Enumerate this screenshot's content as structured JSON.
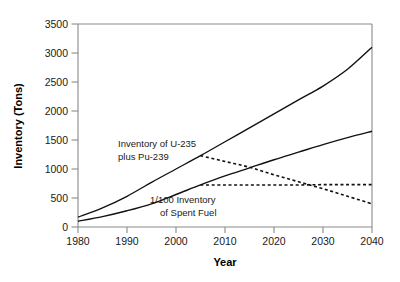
{
  "chart_data": {
    "type": "line",
    "title": "",
    "xlabel": "Year",
    "ylabel": "Inventory (Tons)",
    "xlim": [
      1980,
      2040
    ],
    "ylim": [
      0,
      3500
    ],
    "xticks": [
      1980,
      1990,
      2000,
      2010,
      2020,
      2030,
      2040
    ],
    "yticks": [
      0,
      500,
      1000,
      1500,
      2000,
      2500,
      3000,
      3500
    ],
    "xtick_labels": [
      "1980",
      "1990",
      "2000",
      "2010",
      "2020",
      "2030",
      "2040"
    ],
    "ytick_labels": [
      "0",
      "500",
      "1000",
      "1500",
      "2000",
      "2500",
      "3000",
      "3500"
    ],
    "grid": false,
    "legend": "none",
    "line_color": "#000000",
    "axis_color": "#808080",
    "series": [
      {
        "name": "Inventory of U-235 plus Pu-239",
        "style": "solid",
        "x": [
          1980,
          1985,
          1990,
          1995,
          2000,
          2005,
          2010,
          2015,
          2020,
          2025,
          2030,
          2035,
          2040
        ],
        "values": [
          170,
          330,
          530,
          770,
          1000,
          1230,
          1470,
          1710,
          1950,
          2190,
          2430,
          2720,
          3100
        ]
      },
      {
        "name": "1/100 Inventory of Spent Fuel",
        "style": "solid",
        "x": [
          1980,
          1985,
          1990,
          1995,
          2000,
          2005,
          2010,
          2015,
          2020,
          2025,
          2030,
          2035,
          2040
        ],
        "values": [
          100,
          180,
          280,
          400,
          560,
          725,
          880,
          1020,
          1160,
          1290,
          1420,
          1540,
          1650
        ]
      },
      {
        "name": "Inventory of U-235 plus Pu-239 (declining projection)",
        "style": "dashed",
        "x": [
          2005,
          2010,
          2015,
          2020,
          2025,
          2030,
          2035,
          2040
        ],
        "values": [
          1230,
          1130,
          1030,
          900,
          780,
          660,
          530,
          400
        ]
      },
      {
        "name": "1/100 Inventory of Spent Fuel (flat projection)",
        "style": "dashed",
        "x": [
          2005,
          2010,
          2015,
          2020,
          2025,
          2030,
          2035,
          2040
        ],
        "values": [
          725,
          725,
          725,
          725,
          725,
          730,
          730,
          730
        ]
      }
    ],
    "annotations": [
      {
        "id": "annot-upper",
        "line1": "Inventory of U-235",
        "line2": "plus Pu-239",
        "x": 1998,
        "y": 1530
      },
      {
        "id": "annot-lower",
        "line1": "1/100 Inventory",
        "line2": "of Spent Fuel",
        "x": 2004,
        "y": 560
      }
    ]
  },
  "axes": {
    "x_title": "Year",
    "y_title": "Inventory (Tons)"
  },
  "annotations": {
    "upper_line1": "Inventory of U-235",
    "upper_line2": "plus Pu-239",
    "lower_line1": "1/100 Inventory",
    "lower_line2": "of Spent Fuel"
  },
  "ytick_labels": {
    "t0": "0",
    "t1": "500",
    "t2": "1000",
    "t3": "1500",
    "t4": "2000",
    "t5": "2500",
    "t6": "3000",
    "t7": "3500"
  },
  "xtick_labels": {
    "t0": "1980",
    "t1": "1990",
    "t2": "2000",
    "t3": "2010",
    "t4": "2020",
    "t5": "2030",
    "t6": "2040"
  }
}
